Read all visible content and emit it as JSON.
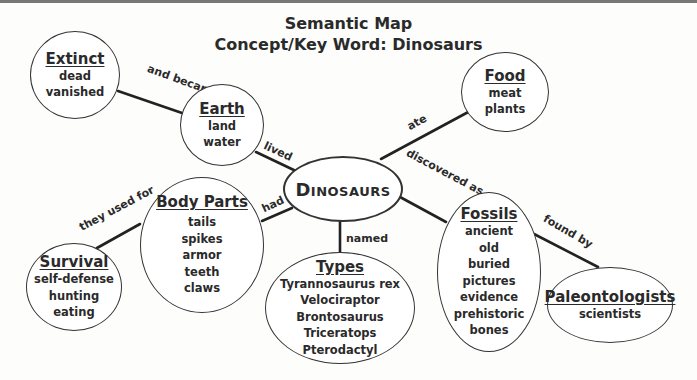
{
  "title": {
    "line1": "Semantic Map",
    "line2": "Concept/Key Word: Dinosaurs"
  },
  "center": {
    "label": "Dinosaurs"
  },
  "nodes": {
    "extinct": {
      "heading": "Extinct",
      "items": [
        "dead",
        "vanished"
      ]
    },
    "earth": {
      "heading": "Earth",
      "items": [
        "land",
        "water"
      ]
    },
    "food": {
      "heading": "Food",
      "items": [
        "meat",
        "plants"
      ]
    },
    "body_parts": {
      "heading": "Body Parts",
      "items": [
        "tails",
        "spikes",
        "armor",
        "teeth",
        "claws"
      ]
    },
    "survival": {
      "heading": "Survival",
      "items": [
        "self-defense",
        "hunting",
        "eating"
      ]
    },
    "types": {
      "heading": "Types",
      "items": [
        "Tyrannosaurus rex",
        "Velociraptor",
        "Brontosaurus",
        "Triceratops",
        "Pterodactyl"
      ]
    },
    "fossils": {
      "heading": "Fossils",
      "items": [
        "ancient",
        "old",
        "buried",
        "pictures",
        "evidence",
        "prehistoric",
        "bones"
      ]
    },
    "paleontologists": {
      "heading": "Paleontologists",
      "items": [
        "scientists"
      ]
    }
  },
  "links": {
    "extinct_earth": "and became",
    "earth_center": "lived",
    "center_food": "ate",
    "center_fossils": "discovered as",
    "center_body": "had",
    "body_survival": "they used for",
    "center_types": "named",
    "fossils_paleo": "found by"
  }
}
